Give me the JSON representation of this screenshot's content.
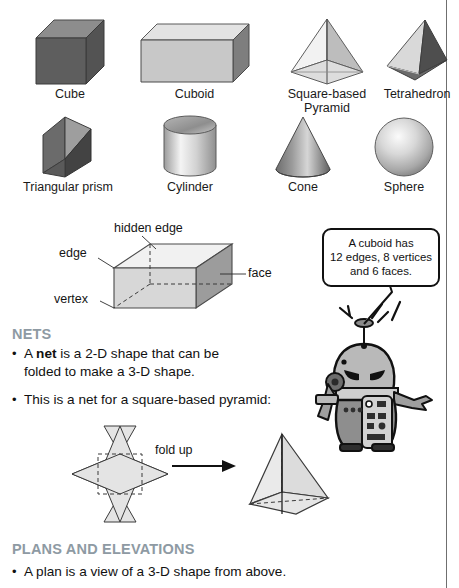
{
  "page": {
    "width": 459,
    "height": 588,
    "background": "#ffffff",
    "rule_color": "#6f6f6f"
  },
  "shape_gallery": {
    "row1": [
      {
        "name": "cube",
        "label": "Cube"
      },
      {
        "name": "cuboid",
        "label": "Cuboid"
      },
      {
        "name": "square-based-pyramid",
        "label": "Square-based\nPyramid"
      },
      {
        "name": "tetrahedron",
        "label": "Tetrahedron"
      }
    ],
    "row2": [
      {
        "name": "triangular-prism",
        "label": "Triangular prism"
      },
      {
        "name": "cylinder",
        "label": "Cylinder"
      },
      {
        "name": "cone",
        "label": "Cone"
      },
      {
        "name": "sphere",
        "label": "Sphere"
      }
    ]
  },
  "anatomy_diagram": {
    "name": "labelled-cuboid",
    "labels": {
      "hidden_edge": "hidden edge",
      "edge": "edge",
      "face": "face",
      "vertex": "vertex"
    }
  },
  "speech_bubble": {
    "text": "A cuboid has 12 edges, 8 vertices and 6 faces.",
    "line1": "A cuboid has",
    "line2": "12 edges, 8 vertices",
    "line3": "and 6 faces."
  },
  "robot": {
    "name": "robot-character",
    "description": "cartoon robot with antenna"
  },
  "nets_section": {
    "heading": "NETS",
    "heading_color": "#8e9aa3",
    "bullets": [
      {
        "bullet": "•",
        "pre": "A ",
        "strong": "net",
        "post": " is a 2-D shape that can be folded to make a 3-D shape."
      },
      {
        "bullet": "•",
        "pre": "This is a net for a square-based pyramid:",
        "strong": "",
        "post": ""
      }
    ],
    "fold_label": "fold up"
  },
  "plans_section": {
    "heading": "PLANS AND ELEVATIONS",
    "heading_color": "#8e9aa3",
    "bullets": [
      {
        "bullet": "•",
        "text": "A plan is a view of a 3-D shape from above."
      }
    ]
  }
}
